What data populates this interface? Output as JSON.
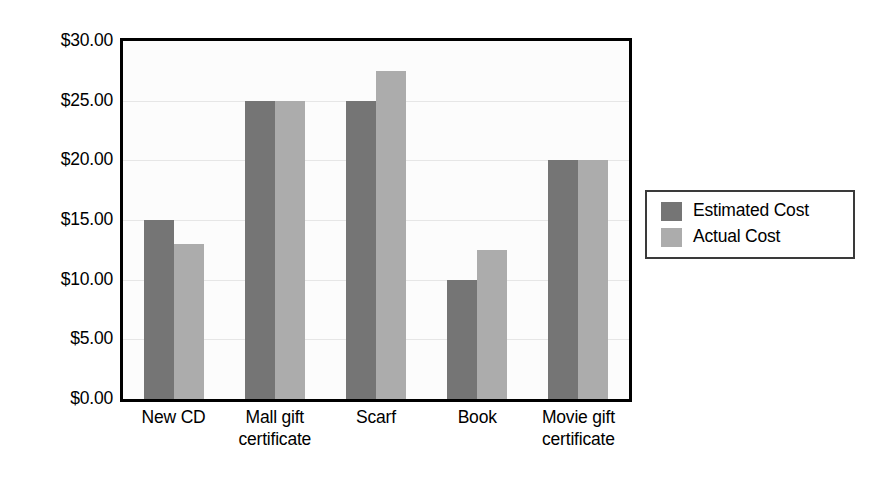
{
  "chart_data": {
    "type": "bar",
    "title": "",
    "xlabel": "",
    "ylabel": "",
    "ylim": [
      0,
      30
    ],
    "ytick_step": 5,
    "grid": true,
    "legend_position": "right",
    "currency_prefix": "$",
    "categories": [
      "New CD",
      "Mall gift certificate",
      "Scarf",
      "Book",
      "Movie gift certificate"
    ],
    "category_lines": [
      [
        "New CD"
      ],
      [
        "Mall gift",
        "certificate"
      ],
      [
        "Scarf"
      ],
      [
        "Book"
      ],
      [
        "Movie gift",
        "certificate"
      ]
    ],
    "ytick_labels": [
      "$0.00",
      "$5.00",
      "$10.00",
      "$15.00",
      "$20.00",
      "$25.00",
      "$30.00"
    ],
    "ytick_values": [
      0,
      5,
      10,
      15,
      20,
      25,
      30
    ],
    "series": [
      {
        "name": "Estimated Cost",
        "color": "#757575",
        "values": [
          15,
          25,
          25,
          10,
          20
        ]
      },
      {
        "name": "Actual Cost",
        "color": "#acacac",
        "values": [
          13,
          25,
          27.5,
          12.5,
          20
        ]
      }
    ]
  },
  "legend": {
    "items": [
      {
        "label": "Estimated Cost",
        "color": "#757575"
      },
      {
        "label": "Actual Cost",
        "color": "#acacac"
      }
    ]
  },
  "colors": {
    "estimated": "#757575",
    "actual": "#acacac",
    "axis": "#000000",
    "gridline": "#e6e6e6",
    "plot_background": "#fcfcfc",
    "legend_border": "#3a3a3a",
    "page_background": "#ffffff"
  }
}
